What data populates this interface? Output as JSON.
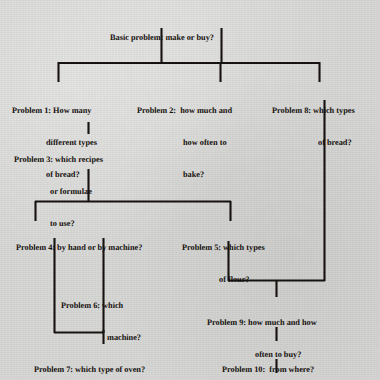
{
  "diagram": {
    "kind": "flowchart",
    "palette": {
      "background": "#d6d6d4",
      "ink": "#16120f",
      "line": "#16120f"
    },
    "nodes": [
      {
        "id": "root",
        "name": "basic-problem",
        "lines": [
          "Basic problem: make or buy?"
        ]
      },
      {
        "id": "p1",
        "name": "problem-1",
        "lines": [
          "Problem 1: How many",
          "different types",
          "of bread?"
        ]
      },
      {
        "id": "p2",
        "name": "problem-2",
        "lines": [
          "Problem 2:  how much and",
          "how often to",
          "bake?"
        ]
      },
      {
        "id": "p8",
        "name": "problem-8",
        "lines": [
          "Problem 8: which types",
          "of bread?"
        ]
      },
      {
        "id": "p3",
        "name": "problem-3",
        "lines": [
          "Problem 3: which recipes",
          "or formulae",
          "to use?"
        ]
      },
      {
        "id": "p4",
        "name": "problem-4",
        "lines": [
          "Problem 4: by hand or by machine?"
        ]
      },
      {
        "id": "p5",
        "name": "problem-5",
        "lines": [
          "Problem 5: which types",
          "of flour?"
        ]
      },
      {
        "id": "p6",
        "name": "problem-6",
        "lines": [
          "Problem 6: which",
          "machine?"
        ]
      },
      {
        "id": "p9",
        "name": "problem-9",
        "lines": [
          "Problem 9: how much and how",
          "often to buy?"
        ]
      },
      {
        "id": "p7",
        "name": "problem-7",
        "lines": [
          "Problem 7: which type of oven?"
        ]
      },
      {
        "id": "p10",
        "name": "problem-10",
        "lines": [
          "Problem 10:  from where?"
        ]
      }
    ],
    "edges": [
      {
        "from": "root",
        "to": "p1"
      },
      {
        "from": "root",
        "to": "p2"
      },
      {
        "from": "root",
        "to": "p8"
      },
      {
        "from": "p1",
        "to": "p3"
      },
      {
        "from": "p3",
        "to": "p4"
      },
      {
        "from": "p3",
        "to": "p5"
      },
      {
        "from": "p4",
        "to": "p6"
      },
      {
        "from": "p4",
        "to": "p7"
      },
      {
        "from": "p6",
        "to": "p7"
      },
      {
        "from": "p5",
        "to": "p9"
      },
      {
        "from": "p8",
        "to": "p9"
      },
      {
        "from": "p9",
        "to": "p10"
      },
      {
        "from": "p10",
        "to": "continues"
      }
    ]
  }
}
